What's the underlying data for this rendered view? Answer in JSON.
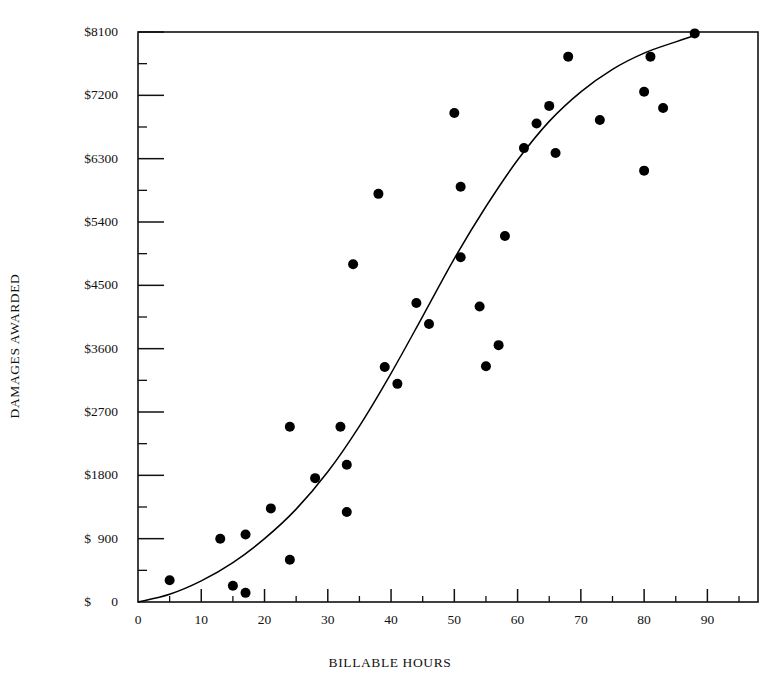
{
  "chart_data": {
    "type": "scatter",
    "title": "",
    "xlabel": "BILLABLE HOURS",
    "ylabel": "DAMAGES AWARDED",
    "xlim": [
      0,
      98
    ],
    "ylim": [
      0,
      8100
    ],
    "grid": false,
    "legend": null,
    "x_ticks": [
      0,
      10,
      20,
      30,
      40,
      50,
      60,
      70,
      80,
      90
    ],
    "x_tick_labels": [
      "0",
      "10",
      "20",
      "30",
      "40",
      "50",
      "60",
      "70",
      "80",
      "90"
    ],
    "x_minor_ticks": [
      5,
      15,
      25,
      35,
      45,
      55,
      65,
      75,
      85,
      95
    ],
    "y_ticks": [
      0,
      900,
      1800,
      2700,
      3600,
      4500,
      5400,
      6300,
      7200,
      8100
    ],
    "y_tick_labels": [
      "$      0",
      "$  900",
      "$1800",
      "$2700",
      "$3600",
      "$4500",
      "$5400",
      "$6300",
      "$7200",
      "$8100"
    ],
    "y_minor_ticks": [
      450,
      1350,
      2250,
      3150,
      4050,
      4950,
      5850,
      6750,
      7650
    ],
    "marker": "filled-circle",
    "marker_color": "#000000",
    "marker_size": 5,
    "line_color": "#000000",
    "points": [
      {
        "x": 5,
        "y": 310
      },
      {
        "x": 13,
        "y": 900
      },
      {
        "x": 15,
        "y": 230
      },
      {
        "x": 17,
        "y": 130
      },
      {
        "x": 17,
        "y": 960
      },
      {
        "x": 21,
        "y": 1330
      },
      {
        "x": 24,
        "y": 2490
      },
      {
        "x": 24,
        "y": 600
      },
      {
        "x": 28,
        "y": 1760
      },
      {
        "x": 32,
        "y": 2490
      },
      {
        "x": 33,
        "y": 1280
      },
      {
        "x": 33,
        "y": 1950
      },
      {
        "x": 34,
        "y": 4800
      },
      {
        "x": 38,
        "y": 5800
      },
      {
        "x": 39,
        "y": 3340
      },
      {
        "x": 41,
        "y": 3100
      },
      {
        "x": 44,
        "y": 4250
      },
      {
        "x": 46,
        "y": 3950
      },
      {
        "x": 50,
        "y": 6950
      },
      {
        "x": 51,
        "y": 4900
      },
      {
        "x": 51,
        "y": 5900
      },
      {
        "x": 54,
        "y": 4200
      },
      {
        "x": 55,
        "y": 3350
      },
      {
        "x": 57,
        "y": 3650
      },
      {
        "x": 58,
        "y": 5200
      },
      {
        "x": 61,
        "y": 6450
      },
      {
        "x": 63,
        "y": 6800
      },
      {
        "x": 65,
        "y": 7050
      },
      {
        "x": 66,
        "y": 6380
      },
      {
        "x": 68,
        "y": 7750
      },
      {
        "x": 73,
        "y": 6850
      },
      {
        "x": 80,
        "y": 7250
      },
      {
        "x": 80,
        "y": 6130
      },
      {
        "x": 81,
        "y": 7750
      },
      {
        "x": 83,
        "y": 7020
      },
      {
        "x": 88,
        "y": 8080
      }
    ],
    "fit_curve": {
      "description": "sigmoid trend line through scatter",
      "points": [
        {
          "x": 0,
          "y": 0
        },
        {
          "x": 5,
          "y": 110
        },
        {
          "x": 10,
          "y": 300
        },
        {
          "x": 15,
          "y": 560
        },
        {
          "x": 20,
          "y": 900
        },
        {
          "x": 25,
          "y": 1320
        },
        {
          "x": 30,
          "y": 1850
        },
        {
          "x": 35,
          "y": 2500
        },
        {
          "x": 40,
          "y": 3250
        },
        {
          "x": 45,
          "y": 4060
        },
        {
          "x": 50,
          "y": 4880
        },
        {
          "x": 55,
          "y": 5620
        },
        {
          "x": 60,
          "y": 6280
        },
        {
          "x": 65,
          "y": 6830
        },
        {
          "x": 70,
          "y": 7250
        },
        {
          "x": 75,
          "y": 7570
        },
        {
          "x": 80,
          "y": 7800
        },
        {
          "x": 85,
          "y": 7960
        },
        {
          "x": 88,
          "y": 8050
        }
      ]
    }
  }
}
